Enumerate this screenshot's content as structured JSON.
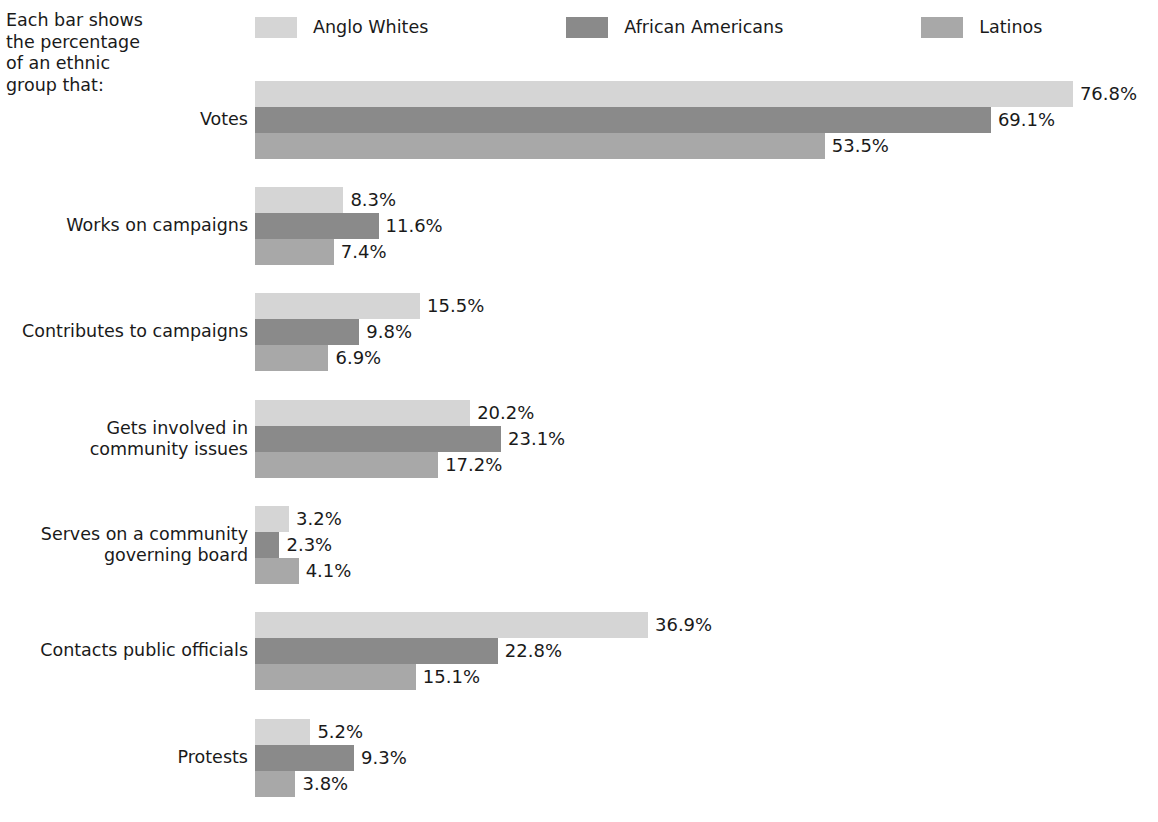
{
  "intro": {
    "text": "Each bar shows\nthe percentage\nof an ethnic\ngroup that:"
  },
  "legend": {
    "items": [
      {
        "label": "Anglo Whites",
        "color": "#d5d5d5",
        "swatch_name": "legend-swatch-anglo-whites"
      },
      {
        "label": "African Americans",
        "color": "#8a8a8a",
        "swatch_name": "legend-swatch-african-americans"
      },
      {
        "label": "Latinos",
        "color": "#a8a8a8",
        "swatch_name": "legend-swatch-latinos"
      }
    ]
  },
  "chart_data": {
    "type": "bar",
    "orientation": "horizontal",
    "title": "",
    "subtitle": "",
    "xlabel": "",
    "ylabel": "",
    "grid": false,
    "legend_position": "top",
    "axis_visible": false,
    "value_suffix": "%",
    "xlim": [
      0,
      76.8
    ],
    "categories": [
      "Votes",
      "Works on campaigns",
      "Contributes to campaigns",
      "Gets involved in\ncommunity issues",
      "Serves on a community\ngoverning board",
      "Contacts public officials",
      "Protests"
    ],
    "series": [
      {
        "name": "Anglo Whites",
        "color": "#d5d5d5",
        "values": [
          76.8,
          8.3,
          15.5,
          20.2,
          3.2,
          36.9,
          5.2
        ],
        "labels": [
          "76.8%",
          "8.3%",
          "15.5%",
          "20.2%",
          "3.2%",
          "36.9%",
          "5.2%"
        ]
      },
      {
        "name": "African Americans",
        "color": "#8a8a8a",
        "values": [
          69.1,
          11.6,
          9.8,
          23.1,
          2.3,
          22.8,
          9.3
        ],
        "labels": [
          "69.1%",
          "11.6%",
          "9.8%",
          "23.1%",
          "2.3%",
          "22.8%",
          "9.3%"
        ]
      },
      {
        "name": "Latinos",
        "color": "#a8a8a8",
        "values": [
          53.5,
          7.4,
          6.9,
          17.2,
          4.1,
          15.1,
          3.8
        ],
        "labels": [
          "53.5%",
          "7.4%",
          "6.9%",
          "17.2%",
          "4.1%",
          "15.1%",
          "3.8%"
        ]
      }
    ]
  },
  "layout": {
    "bar_origin_x": 255,
    "px_per_percent": 10.65,
    "bar_height": 26,
    "group_tops": [
      81,
      187,
      293,
      400,
      506,
      612,
      719
    ]
  }
}
